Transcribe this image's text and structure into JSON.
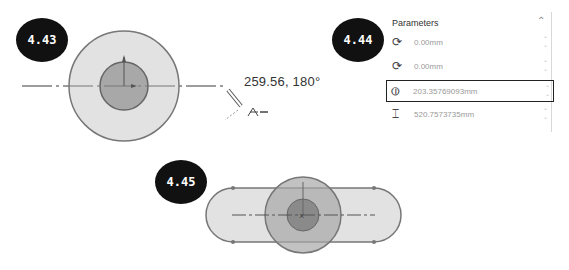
{
  "badges": [
    {
      "label": "4.43"
    },
    {
      "label": "4.44"
    },
    {
      "label": "4.45"
    }
  ],
  "figure_443": {
    "coordinate_readout": "259.56, 180°"
  },
  "parameters_panel": {
    "title": "Parameters",
    "collapse_icon": "chevron-up-icon",
    "rows": [
      {
        "icon": "center-x-icon",
        "value": "0.00mm"
      },
      {
        "icon": "center-y-icon",
        "value": "0.00mm"
      },
      {
        "icon": "diameter-icon",
        "value": "203.35769093mm",
        "active": true
      },
      {
        "icon": "length-icon",
        "value": "520.7573735mm"
      }
    ]
  },
  "colors": {
    "outer_fill": "#e2e2e2",
    "inner_fill": "#a8a8a8",
    "outline": "#7a7a7a",
    "badge": "#111111"
  }
}
